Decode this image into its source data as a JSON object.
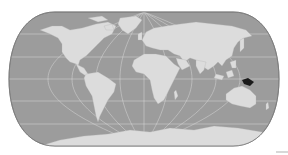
{
  "map": {
    "type": "world-locator-map",
    "projection": "pseudocylindrical (rounded-edge)",
    "highlighted_region": "Papua New Guinea",
    "colors": {
      "ocean": "#9c9c9c",
      "land": "#dcdcdc",
      "graticule": "#e8e8e8",
      "highlight": "#1a1a1a",
      "border": "#7a7a7a",
      "background": "#ffffff"
    },
    "graticule": {
      "parallels_count": 5,
      "meridians_count": 11
    }
  }
}
